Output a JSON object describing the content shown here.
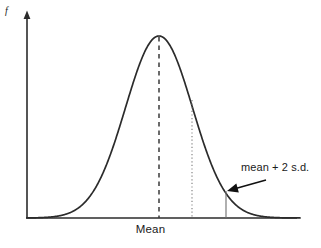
{
  "figure": {
    "background_color": "#ffffff",
    "ink_color": "#2b2b2b"
  },
  "axes": {
    "y_axis_label": "f",
    "x_axis_label": "Mean",
    "y_axis_has_arrow": true,
    "x_axis_has_arrow": false,
    "origin_px": {
      "x": 27,
      "y": 218
    },
    "x_axis_end_px": {
      "x": 297,
      "y": 218
    },
    "y_axis_top_px": {
      "x": 27,
      "y": 12
    }
  },
  "annotations": {
    "arrow_label": "mean + 2 s.d.",
    "arrow_from_px": {
      "x": 266,
      "y": 180
    },
    "arrow_to_px": {
      "x": 227,
      "y": 191
    }
  },
  "markers": [
    {
      "name": "mean-line",
      "style": "dashed",
      "x_px": 159,
      "top_px": 37,
      "bottom_px": 218
    },
    {
      "name": "one-sd-line",
      "style": "dotted",
      "x_px": 192,
      "top_px": 100,
      "bottom_px": 218
    },
    {
      "name": "two-sd-line",
      "style": "solid",
      "x_px": 226,
      "top_px": 191,
      "bottom_px": 218
    }
  ],
  "chart_data": {
    "type": "line",
    "title": "",
    "xlabel": "Mean",
    "ylabel": "f",
    "grid": false,
    "legend": null,
    "curve_name": "normal probability density",
    "mean_x_px": 159,
    "sd_px": 33.5,
    "peak_y_px": 36,
    "baseline_y_px": 218,
    "x_px_range": [
      27,
      300
    ],
    "x_in_sd_units": [
      -3.94,
      4.21
    ],
    "annotations": [
      "mean + 2 s.d."
    ],
    "x": [
      -3.94,
      -3.6,
      -3.2,
      -2.8,
      -2.4,
      -2.0,
      -1.8,
      -1.6,
      -1.4,
      -1.2,
      -1.0,
      -0.8,
      -0.6,
      -0.4,
      -0.2,
      0,
      0.2,
      0.4,
      0.6,
      0.8,
      1.0,
      1.2,
      1.4,
      1.6,
      1.8,
      2.0,
      2.4,
      2.8,
      3.2,
      3.6,
      4.21
    ],
    "y": [
      0.0002,
      0.0012,
      0.0056,
      0.0208,
      0.0608,
      0.1353,
      0.1979,
      0.278,
      0.3753,
      0.4868,
      0.6065,
      0.7261,
      0.8353,
      0.9231,
      0.9802,
      1.0,
      0.9802,
      0.9231,
      0.8353,
      0.7261,
      0.6065,
      0.4868,
      0.3753,
      0.278,
      0.1979,
      0.1353,
      0.0608,
      0.0208,
      0.0056,
      0.0012,
      0.0001
    ],
    "ylim": [
      0,
      1.05
    ]
  }
}
